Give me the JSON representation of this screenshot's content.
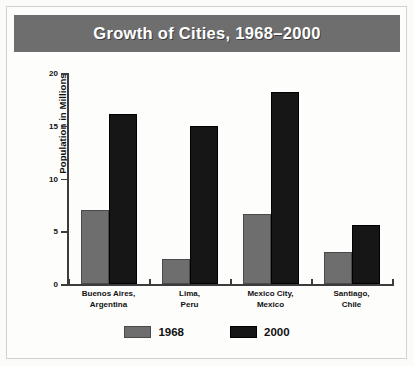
{
  "figure": {
    "background_color": "#fbfbfa",
    "frame_color": "#d2d2d2"
  },
  "title": {
    "text": "Growth of Cities, 1968–2000",
    "banner_color": "#6e6e6e",
    "text_color": "#ffffff"
  },
  "legend": {
    "position": "bottom-center",
    "entries": [
      {
        "label": "1968",
        "color": "#6e6e6e"
      },
      {
        "label": "2000",
        "color": "#161616"
      }
    ]
  },
  "axes": {
    "ylabel": "Population in Millions",
    "yticks": [
      "0",
      "5",
      "10",
      "15",
      "20"
    ],
    "xlabel": ""
  },
  "chart_data": {
    "type": "bar",
    "title": "Growth of Cities, 1968–2000",
    "xlabel": "",
    "ylabel": "Population in Millions",
    "ylim": [
      0,
      20
    ],
    "yticks": [
      0,
      5,
      10,
      15,
      20
    ],
    "grid": false,
    "legend_position": "bottom-center",
    "categories": [
      "Buenos Aires,\nArgentina",
      "Lima,\nPeru",
      "Mexico City,\nMexico",
      "Santiago,\nChile"
    ],
    "category_lines": [
      [
        "Buenos Aires,",
        "Argentina"
      ],
      [
        "Lima,",
        "Peru"
      ],
      [
        "Mexico City,",
        "Mexico"
      ],
      [
        "Santiago,",
        "Chile"
      ]
    ],
    "series": [
      {
        "name": "1968",
        "color": "#6e6e6e",
        "values": [
          7.0,
          2.4,
          6.6,
          3.0
        ]
      },
      {
        "name": "2000",
        "color": "#161616",
        "values": [
          16.1,
          15.0,
          18.2,
          5.6
        ]
      }
    ]
  }
}
